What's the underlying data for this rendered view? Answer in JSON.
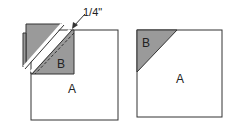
{
  "diagram": {
    "left_figure": {
      "square_label": "A",
      "triangle_label": "B",
      "dimension_label": "1/4\""
    },
    "right_figure": {
      "square_label": "A",
      "triangle_label": "B"
    },
    "colors": {
      "shade": "#9a9a9a",
      "stroke": "#333333",
      "background": "#ffffff"
    }
  }
}
